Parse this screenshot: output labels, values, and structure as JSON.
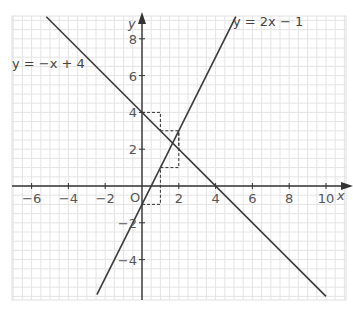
{
  "chart_data": {
    "type": "line",
    "title": "",
    "xlabel": "x",
    "ylabel": "y",
    "origin_label": "O",
    "xlim": [
      -7,
      11
    ],
    "ylim": [
      -6,
      9
    ],
    "grid": true,
    "x_ticks": [
      -6,
      -4,
      -2,
      2,
      4,
      6,
      8,
      10
    ],
    "y_ticks": [
      8,
      6,
      4,
      2,
      -2,
      -4
    ],
    "x_tick_labels": [
      "−6",
      "−4",
      "−2",
      "2",
      "4",
      "6",
      "8",
      "10"
    ],
    "y_tick_labels": [
      "8",
      "6",
      "4",
      "2",
      "−2",
      "−4"
    ],
    "series": [
      {
        "name": "y = −x + 4",
        "equation": "y = -x + 4",
        "slope": -1,
        "intercept": 4,
        "x": [
          -5.2,
          10
        ],
        "y": [
          9.2,
          -6
        ]
      },
      {
        "name": "y = 2x − 1",
        "equation": "y = 2x - 1",
        "slope": 2,
        "intercept": -1,
        "x": [
          -2.45,
          5.1
        ],
        "y": [
          -5.9,
          9.2
        ]
      }
    ],
    "annotations": {
      "slope_triangles_dashed": [
        {
          "line": "y = -x + 4",
          "points": [
            [
              0,
              4
            ],
            [
              1,
              4
            ],
            [
              1,
              3
            ]
          ]
        },
        {
          "line": "y = -x + 4",
          "points": [
            [
              1,
              3
            ],
            [
              2,
              3
            ],
            [
              2,
              2
            ]
          ]
        },
        {
          "line": "y = 2x - 1",
          "points": [
            [
              0,
              -1
            ],
            [
              1,
              -1
            ],
            [
              1,
              1
            ]
          ]
        },
        {
          "line": "y = 2x - 1",
          "points": [
            [
              1,
              1
            ],
            [
              2,
              1
            ],
            [
              2,
              3
            ]
          ]
        }
      ]
    },
    "legend": [
      "y = −x + 4",
      "y = 2x − 1"
    ]
  },
  "labels": {
    "eq1": "y = −x + 4",
    "eq2": "y = 2x − 1",
    "x_axis": "x",
    "y_axis": "y",
    "origin": "O"
  }
}
